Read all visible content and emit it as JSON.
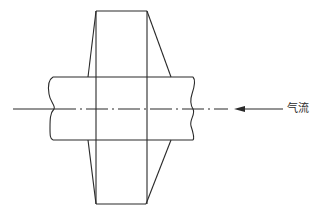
{
  "diagram": {
    "title": "",
    "labels": {
      "airflow": "气流"
    },
    "arrow": {
      "direction": "left",
      "label_ref": "airflow"
    },
    "colors": {
      "line": "#2a2a2a",
      "background": "#ffffff"
    }
  }
}
